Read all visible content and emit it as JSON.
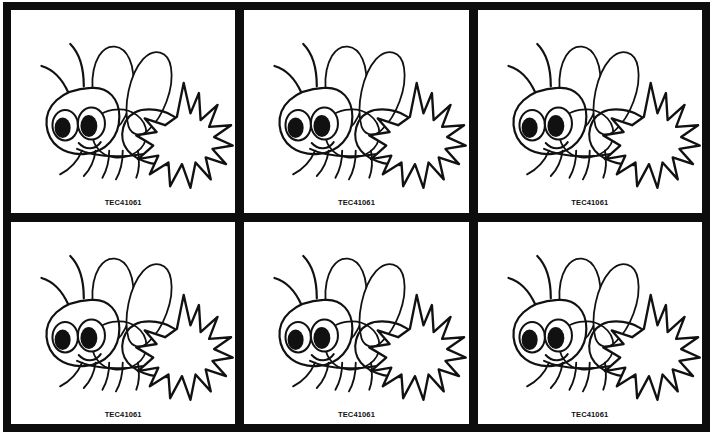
{
  "sheet": {
    "type": "clip-art-contact-sheet",
    "columns": 3,
    "rows": 2,
    "border_color": "#0d0d0d",
    "panel_background": "#ffffff",
    "ink_color": "#111111"
  },
  "artwork": {
    "subject": "cartoon-bee-line-art",
    "description": "Black outline cartoon bee with two large eyes, two antennae, two overlapping teardrop wings, segmented body, six legs and a spiky starburst tail",
    "style": "black-and-white-outline",
    "eye_fill": "#111111",
    "eye_white": "#ffffff"
  },
  "panels": [
    {
      "id": "panel-1",
      "label": "TEC41061",
      "row": 1,
      "column": 1
    },
    {
      "id": "panel-2",
      "label": "TEC41061",
      "row": 1,
      "column": 2
    },
    {
      "id": "panel-3",
      "label": "TEC41061",
      "row": 1,
      "column": 3
    },
    {
      "id": "panel-4",
      "label": "TEC41061",
      "row": 2,
      "column": 1
    },
    {
      "id": "panel-5",
      "label": "TEC41061",
      "row": 2,
      "column": 2
    },
    {
      "id": "panel-6",
      "label": "TEC41061",
      "row": 2,
      "column": 3
    }
  ]
}
